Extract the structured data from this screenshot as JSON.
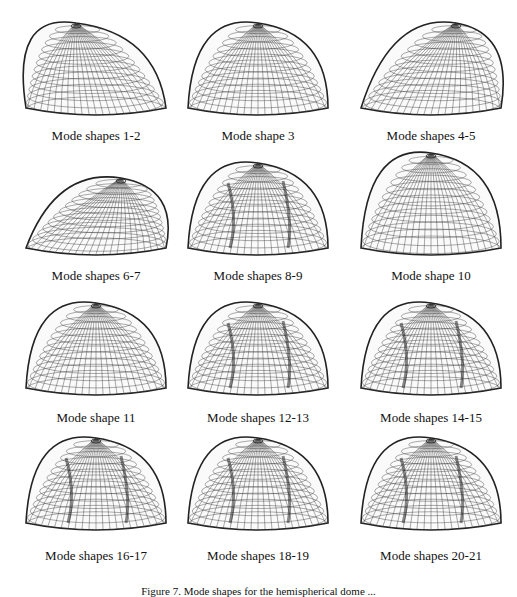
{
  "figure": {
    "panels": [
      {
        "label": "Mode shapes 1-2",
        "shape": "tilted-dome"
      },
      {
        "label": "Mode shape 3",
        "shape": "bell-dome"
      },
      {
        "label": "Mode shapes 4-5",
        "shape": "skewed-peak"
      },
      {
        "label": "Mode shapes 6-7",
        "shape": "skewed-peak-low"
      },
      {
        "label": "Mode shapes 8-9",
        "shape": "wavy-dome"
      },
      {
        "label": "Mode shape 10",
        "shape": "pointed-dome"
      },
      {
        "label": "Mode shape 11",
        "shape": "round-dome"
      },
      {
        "label": "Mode shapes 12-13",
        "shape": "wavy-dome"
      },
      {
        "label": "Mode shapes 14-15",
        "shape": "lobed-dome"
      },
      {
        "label": "Mode shapes 16-17",
        "shape": "twisted-dome"
      },
      {
        "label": "Mode shapes 18-19",
        "shape": "lobed-crown"
      },
      {
        "label": "Mode shapes 20-21",
        "shape": "lobed-crown"
      }
    ],
    "caption": "Figure 7. Mode shapes for the hemispherical dome ..."
  }
}
